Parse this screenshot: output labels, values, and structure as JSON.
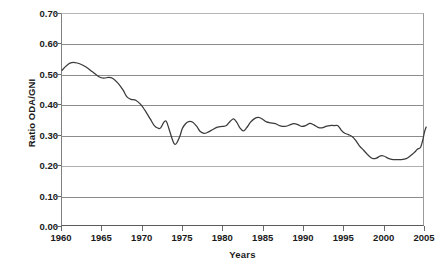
{
  "chart_data": {
    "type": "line",
    "title": "",
    "xlabel": "Years",
    "ylabel": "Ratio ODA/GNI",
    "xlim": [
      1960,
      2005
    ],
    "ylim": [
      0.0,
      0.7
    ],
    "grid": true,
    "legend": "none",
    "line_color": "#3a3a3a",
    "gridline_color": "#8c8c8c",
    "x_tick_labels": [
      "1960",
      "1965",
      "1970",
      "1975",
      "1980",
      "1985",
      "1990",
      "1995",
      "2000",
      "2005"
    ],
    "x_tick_values": [
      1960,
      1965,
      1970,
      1975,
      1980,
      1985,
      1990,
      1995,
      2000,
      2005
    ],
    "y_tick_labels": [
      "0.70",
      "0.60",
      "0.50",
      "0.40",
      "0.30",
      "0.20",
      "0.10",
      "0.00"
    ],
    "y_tick_values": [
      0.7,
      0.6,
      0.5,
      0.4,
      0.3,
      0.2,
      0.1,
      0.0
    ],
    "series": [
      {
        "name": "Ratio ODA/GNI",
        "x": [
          1960,
          1961,
          1962,
          1963,
          1964,
          1965,
          1966,
          1967,
          1968,
          1969,
          1970,
          1971,
          1972,
          1973,
          1974,
          1975,
          1976,
          1977,
          1978,
          1979,
          1980,
          1981,
          1982,
          1983,
          1984,
          1985,
          1986,
          1987,
          1988,
          1989,
          1990,
          1991,
          1992,
          1993,
          1994,
          1995,
          1996,
          1997,
          1998,
          1999,
          2000,
          2001,
          2002,
          2003,
          2004,
          2005
        ],
        "values": [
          0.515,
          0.538,
          0.537,
          0.523,
          0.505,
          0.488,
          0.492,
          0.47,
          0.43,
          0.415,
          0.418,
          0.372,
          0.322,
          0.32,
          0.345,
          0.3,
          0.268,
          0.31,
          0.333,
          0.322,
          0.305,
          0.308,
          0.32,
          0.327,
          0.331,
          0.33,
          0.35,
          0.33,
          0.327,
          0.355,
          0.358,
          0.343,
          0.34,
          0.33,
          0.33,
          0.338,
          0.33,
          0.335,
          0.328,
          0.33,
          0.33,
          0.329,
          0.326,
          0.33,
          0.332,
          0.33
        ]
      }
    ],
    "series_extended_note": "full annual trace",
    "trace": [
      {
        "x": 1960.0,
        "y": 0.513
      },
      {
        "x": 1960.5,
        "y": 0.527
      },
      {
        "x": 1961.0,
        "y": 0.537
      },
      {
        "x": 1961.6,
        "y": 0.539
      },
      {
        "x": 1962.2,
        "y": 0.535
      },
      {
        "x": 1963.0,
        "y": 0.524
      },
      {
        "x": 1963.8,
        "y": 0.508
      },
      {
        "x": 1964.6,
        "y": 0.492
      },
      {
        "x": 1965.2,
        "y": 0.487
      },
      {
        "x": 1965.8,
        "y": 0.49
      },
      {
        "x": 1966.3,
        "y": 0.487
      },
      {
        "x": 1967.0,
        "y": 0.47
      },
      {
        "x": 1967.6,
        "y": 0.448
      },
      {
        "x": 1968.1,
        "y": 0.425
      },
      {
        "x": 1968.6,
        "y": 0.417
      },
      {
        "x": 1969.2,
        "y": 0.414
      },
      {
        "x": 1969.8,
        "y": 0.4
      },
      {
        "x": 1970.4,
        "y": 0.378
      },
      {
        "x": 1971.0,
        "y": 0.352
      },
      {
        "x": 1971.5,
        "y": 0.33
      },
      {
        "x": 1972.0,
        "y": 0.321
      },
      {
        "x": 1972.3,
        "y": 0.322
      },
      {
        "x": 1972.7,
        "y": 0.341
      },
      {
        "x": 1973.0,
        "y": 0.344
      },
      {
        "x": 1973.3,
        "y": 0.322
      },
      {
        "x": 1973.7,
        "y": 0.288
      },
      {
        "x": 1974.0,
        "y": 0.269
      },
      {
        "x": 1974.3,
        "y": 0.272
      },
      {
        "x": 1974.7,
        "y": 0.295
      },
      {
        "x": 1975.0,
        "y": 0.32
      },
      {
        "x": 1975.4,
        "y": 0.336
      },
      {
        "x": 1975.8,
        "y": 0.343
      },
      {
        "x": 1976.3,
        "y": 0.341
      },
      {
        "x": 1976.8,
        "y": 0.327
      },
      {
        "x": 1977.2,
        "y": 0.311
      },
      {
        "x": 1977.7,
        "y": 0.304
      },
      {
        "x": 1978.2,
        "y": 0.308
      },
      {
        "x": 1978.8,
        "y": 0.317
      },
      {
        "x": 1979.4,
        "y": 0.325
      },
      {
        "x": 1980.0,
        "y": 0.327
      },
      {
        "x": 1980.5,
        "y": 0.33
      },
      {
        "x": 1981.0,
        "y": 0.345
      },
      {
        "x": 1981.4,
        "y": 0.352
      },
      {
        "x": 1981.8,
        "y": 0.34
      },
      {
        "x": 1982.2,
        "y": 0.321
      },
      {
        "x": 1982.6,
        "y": 0.312
      },
      {
        "x": 1983.0,
        "y": 0.322
      },
      {
        "x": 1983.5,
        "y": 0.341
      },
      {
        "x": 1984.0,
        "y": 0.353
      },
      {
        "x": 1984.5,
        "y": 0.357
      },
      {
        "x": 1985.0,
        "y": 0.351
      },
      {
        "x": 1985.5,
        "y": 0.342
      },
      {
        "x": 1986.0,
        "y": 0.339
      },
      {
        "x": 1986.6,
        "y": 0.336
      },
      {
        "x": 1987.2,
        "y": 0.329
      },
      {
        "x": 1987.8,
        "y": 0.327
      },
      {
        "x": 1988.3,
        "y": 0.331
      },
      {
        "x": 1988.9,
        "y": 0.336
      },
      {
        "x": 1989.4,
        "y": 0.333
      },
      {
        "x": 1989.9,
        "y": 0.327
      },
      {
        "x": 1990.4,
        "y": 0.33
      },
      {
        "x": 1990.9,
        "y": 0.337
      },
      {
        "x": 1991.4,
        "y": 0.332
      },
      {
        "x": 1991.9,
        "y": 0.324
      },
      {
        "x": 1992.4,
        "y": 0.322
      },
      {
        "x": 1992.9,
        "y": 0.327
      },
      {
        "x": 1993.4,
        "y": 0.33
      },
      {
        "x": 1994.0,
        "y": 0.33
      },
      {
        "x": 1994.4,
        "y": 0.329
      },
      {
        "x": 1994.8,
        "y": 0.315
      },
      {
        "x": 1995.2,
        "y": 0.305
      },
      {
        "x": 1995.7,
        "y": 0.3
      },
      {
        "x": 1996.2,
        "y": 0.293
      },
      {
        "x": 1996.7,
        "y": 0.277
      },
      {
        "x": 1997.1,
        "y": 0.262
      },
      {
        "x": 1997.6,
        "y": 0.248
      },
      {
        "x": 1998.0,
        "y": 0.236
      },
      {
        "x": 1998.4,
        "y": 0.226
      },
      {
        "x": 1998.8,
        "y": 0.22
      },
      {
        "x": 1999.2,
        "y": 0.222
      },
      {
        "x": 1999.7,
        "y": 0.229
      },
      {
        "x": 2000.1,
        "y": 0.229
      },
      {
        "x": 2000.6,
        "y": 0.222
      },
      {
        "x": 2001.1,
        "y": 0.218
      },
      {
        "x": 2001.7,
        "y": 0.217
      },
      {
        "x": 2002.3,
        "y": 0.217
      },
      {
        "x": 2002.9,
        "y": 0.22
      },
      {
        "x": 2003.4,
        "y": 0.229
      },
      {
        "x": 2003.9,
        "y": 0.24
      },
      {
        "x": 2004.3,
        "y": 0.251
      },
      {
        "x": 2004.7,
        "y": 0.258
      },
      {
        "x": 2005.0,
        "y": 0.285
      },
      {
        "x": 2005.2,
        "y": 0.31
      },
      {
        "x": 2005.4,
        "y": 0.325
      }
    ]
  }
}
